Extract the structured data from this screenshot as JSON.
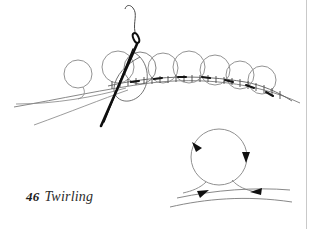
{
  "figure": {
    "number": "46",
    "title": "Twirling",
    "colors": {
      "background": "#ffffff",
      "thread_line": "#6e6e6e",
      "loop_outline": "#8a8a8a",
      "needle_dark": "#111111",
      "stitch_tick": "#3a3a3a",
      "caption_text": "#2b2b2b",
      "border_rule": "#c9c9c9"
    },
    "main_diagram": {
      "name": "twirling-row-of-loops",
      "loop_count": 8,
      "loops": [
        {
          "cx": 78,
          "cy": 74,
          "r": 14
        },
        {
          "cx": 118,
          "cy": 67,
          "r": 16
        },
        {
          "cx": 140,
          "cy": 68,
          "r": 16
        },
        {
          "cx": 163,
          "cy": 68,
          "r": 15
        },
        {
          "cx": 189,
          "cy": 67,
          "r": 16
        },
        {
          "cx": 215,
          "cy": 70,
          "r": 15
        },
        {
          "cx": 240,
          "cy": 75,
          "r": 14
        },
        {
          "cx": 262,
          "cy": 80,
          "r": 14
        }
      ],
      "needle": {
        "name": "sewing-needle",
        "eye_cx": 136,
        "eye_cy": 39,
        "tip_x": 101,
        "tip_y": 126
      },
      "thread_tails": 2,
      "stitch_ticks": 22
    },
    "detail_diagram": {
      "name": "loop-formation-detail",
      "loop": {
        "cx": 219,
        "cy": 157,
        "r": 28
      },
      "arrows": [
        {
          "name": "arrow-loop-upper-left",
          "direction": "up-left"
        },
        {
          "name": "arrow-loop-right",
          "direction": "down"
        },
        {
          "name": "arrow-thread-left",
          "direction": "right"
        },
        {
          "name": "arrow-thread-right",
          "direction": "left"
        }
      ]
    }
  }
}
